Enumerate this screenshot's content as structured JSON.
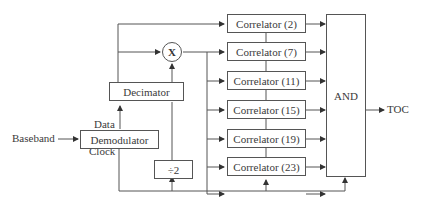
{
  "diagram": {
    "inputs": {
      "baseband": "Baseband"
    },
    "outputs": {
      "toc": "TOC"
    },
    "blocks": {
      "demodulator": "Demodulator",
      "decimator": "Decimator",
      "divider": "÷2",
      "multiplier": "X",
      "and_gate": "AND"
    },
    "port_labels": {
      "data": "Data",
      "clock": "Clock"
    },
    "correlators": [
      {
        "label": "Correlator (2)"
      },
      {
        "label": "Correlator (7)"
      },
      {
        "label": "Correlator (11)"
      },
      {
        "label": "Correlator (15)"
      },
      {
        "label": "Correlator (19)"
      },
      {
        "label": "Correlator (23)"
      }
    ]
  }
}
